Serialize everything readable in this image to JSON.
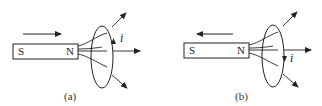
{
  "figure": {
    "panels": [
      {
        "caption": "(a)",
        "magnet": {
          "left_pole": "S",
          "right_pole": "N"
        },
        "motion_direction": "right",
        "current_label": "i",
        "current_direction": "up"
      },
      {
        "caption": "(b)",
        "magnet": {
          "left_pole": "S",
          "right_pole": "N"
        },
        "motion_direction": "left",
        "current_label": "i",
        "current_direction": "down"
      }
    ],
    "colors": {
      "stroke": "#222222",
      "background": "#ffffff"
    }
  }
}
